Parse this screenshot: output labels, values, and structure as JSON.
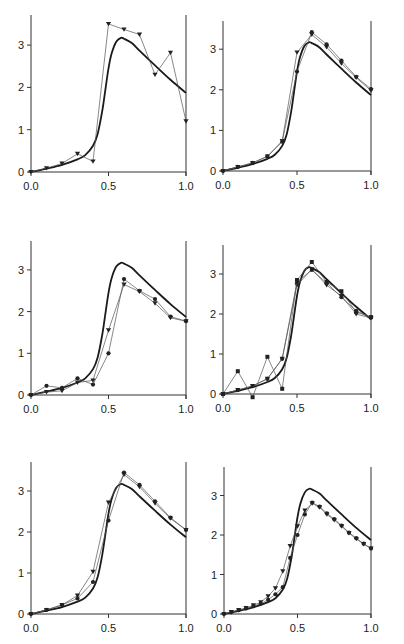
{
  "figure": {
    "width": 404,
    "height": 644,
    "colors": {
      "axis": "#333333",
      "reference": "#1a1a1a",
      "data": "#555555",
      "marker": "#222222"
    }
  },
  "reference_curve": {
    "name": "reference",
    "x": [
      0.0,
      0.1,
      0.2,
      0.3,
      0.35,
      0.4,
      0.43,
      0.46,
      0.48,
      0.5,
      0.52,
      0.55,
      0.58,
      0.6,
      0.65,
      0.7,
      0.8,
      0.9,
      1.0
    ],
    "y": [
      0.0,
      0.08,
      0.17,
      0.3,
      0.4,
      0.62,
      0.9,
      1.45,
      1.95,
      2.45,
      2.8,
      3.08,
      3.17,
      3.15,
      3.05,
      2.87,
      2.52,
      2.18,
      1.87
    ]
  },
  "chart_data": [
    {
      "type": "line",
      "panel": "top-left",
      "xlabel": "",
      "ylabel": "",
      "xlim": [
        0,
        1
      ],
      "ylim": [
        0,
        3.7
      ],
      "xticks": [
        "0.0",
        "0.5",
        "1.0"
      ],
      "yticks": [
        "0",
        "1",
        "2",
        "3"
      ],
      "grid": false,
      "series": [
        {
          "name": "reference",
          "style": "thick",
          "ref": true
        },
        {
          "name": "triangles",
          "marker": "triangle-down",
          "x": [
            0.0,
            0.1,
            0.2,
            0.3,
            0.4,
            0.5,
            0.6,
            0.7,
            0.8,
            0.9,
            1.0
          ],
          "y": [
            0.0,
            0.09,
            0.2,
            0.43,
            0.25,
            3.5,
            3.37,
            3.25,
            2.3,
            2.82,
            1.2
          ]
        }
      ]
    },
    {
      "type": "line",
      "panel": "top-right",
      "xlim": [
        0,
        1
      ],
      "ylim": [
        0,
        3.7
      ],
      "xticks": [
        "0.0",
        "0.5",
        "1.0"
      ],
      "yticks": [
        "0",
        "1",
        "2",
        "3"
      ],
      "grid": false,
      "series": [
        {
          "name": "reference",
          "style": "thick",
          "ref": true
        },
        {
          "name": "triangles",
          "marker": "triangle-down",
          "x": [
            0.0,
            0.1,
            0.2,
            0.3,
            0.4,
            0.5,
            0.6,
            0.7,
            0.8,
            0.9,
            1.0
          ],
          "y": [
            0.0,
            0.1,
            0.2,
            0.36,
            0.74,
            2.92,
            3.36,
            3.05,
            2.65,
            2.3,
            1.98
          ]
        },
        {
          "name": "circles",
          "marker": "circle",
          "x": [
            0.0,
            0.1,
            0.2,
            0.3,
            0.4,
            0.5,
            0.6,
            0.7,
            0.8,
            0.9,
            1.0
          ],
          "y": [
            0.0,
            0.1,
            0.2,
            0.36,
            0.72,
            2.45,
            3.42,
            3.12,
            2.72,
            2.32,
            2.02
          ]
        }
      ]
    },
    {
      "type": "line",
      "panel": "middle-left",
      "xlim": [
        0,
        1
      ],
      "ylim": [
        0,
        3.7
      ],
      "xticks": [
        "0.0",
        "0.5",
        "1.0"
      ],
      "yticks": [
        "0",
        "1",
        "2",
        "3"
      ],
      "grid": false,
      "series": [
        {
          "name": "reference",
          "style": "thick",
          "ref": true
        },
        {
          "name": "triangles",
          "marker": "triangle-down",
          "x": [
            0.0,
            0.1,
            0.2,
            0.3,
            0.4,
            0.5,
            0.6,
            0.7,
            0.8,
            0.9,
            1.0
          ],
          "y": [
            0.0,
            0.07,
            0.1,
            0.3,
            0.35,
            1.55,
            2.65,
            2.48,
            2.2,
            1.85,
            1.77
          ]
        },
        {
          "name": "circles",
          "marker": "circle",
          "x": [
            0.0,
            0.1,
            0.2,
            0.3,
            0.4,
            0.5,
            0.6,
            0.7,
            0.8,
            0.9,
            1.0
          ],
          "y": [
            0.0,
            0.22,
            0.17,
            0.4,
            0.25,
            1.0,
            2.78,
            2.5,
            2.3,
            1.88,
            1.77
          ]
        }
      ]
    },
    {
      "type": "line",
      "panel": "middle-right",
      "xlim": [
        0,
        1
      ],
      "ylim": [
        0,
        3.7
      ],
      "xticks": [
        "0.0",
        "0.5",
        "1.0"
      ],
      "yticks": [
        "0",
        "1",
        "2",
        "3"
      ],
      "grid": false,
      "series": [
        {
          "name": "reference",
          "style": "thick",
          "ref": true
        },
        {
          "name": "squares",
          "marker": "square",
          "x": [
            0.0,
            0.1,
            0.2,
            0.3,
            0.4,
            0.5,
            0.6,
            0.7,
            0.8,
            0.9,
            1.0
          ],
          "y": [
            0.0,
            0.57,
            -0.08,
            0.93,
            0.13,
            2.85,
            3.3,
            2.8,
            2.57,
            2.05,
            1.92
          ]
        },
        {
          "name": "triangles",
          "marker": "triangle-down",
          "x": [
            0.0,
            0.1,
            0.2,
            0.3,
            0.4,
            0.5,
            0.6,
            0.7,
            0.8,
            0.9,
            1.0
          ],
          "y": [
            0.0,
            0.1,
            0.2,
            0.38,
            0.88,
            2.72,
            3.12,
            2.72,
            2.45,
            2.0,
            1.9
          ]
        },
        {
          "name": "circles",
          "marker": "circle",
          "x": [
            0.0,
            0.1,
            0.2,
            0.3,
            0.4,
            0.5,
            0.6,
            0.7,
            0.8,
            0.9,
            1.0
          ],
          "y": [
            0.0,
            0.1,
            0.2,
            0.38,
            0.88,
            2.8,
            3.1,
            2.78,
            2.42,
            2.08,
            1.92
          ]
        }
      ]
    },
    {
      "type": "line",
      "panel": "bottom-left",
      "xlim": [
        0,
        1
      ],
      "ylim": [
        0,
        3.7
      ],
      "xticks": [
        "0.0",
        "0.5",
        "1.0"
      ],
      "yticks": [
        "0",
        "1",
        "2",
        "3"
      ],
      "grid": false,
      "series": [
        {
          "name": "reference",
          "style": "thick",
          "ref": true
        },
        {
          "name": "triangles",
          "marker": "triangle-down",
          "x": [
            0.0,
            0.1,
            0.2,
            0.3,
            0.4,
            0.5,
            0.6,
            0.7,
            0.8,
            0.9,
            1.0
          ],
          "y": [
            0.0,
            0.1,
            0.22,
            0.45,
            1.03,
            2.72,
            3.4,
            3.1,
            2.7,
            2.33,
            2.05
          ]
        },
        {
          "name": "circles",
          "marker": "circle",
          "x": [
            0.0,
            0.1,
            0.2,
            0.3,
            0.4,
            0.5,
            0.6,
            0.7,
            0.8,
            0.9,
            1.0
          ],
          "y": [
            0.0,
            0.1,
            0.22,
            0.38,
            0.78,
            2.28,
            3.45,
            3.15,
            2.75,
            2.35,
            2.05
          ]
        }
      ]
    },
    {
      "type": "line",
      "panel": "bottom-right",
      "xlim": [
        0,
        1
      ],
      "ylim": [
        0,
        3.7
      ],
      "xticks": [
        "0.0",
        "0.5",
        "1.0"
      ],
      "yticks": [
        "0",
        "1",
        "2",
        "3"
      ],
      "grid": false,
      "series": [
        {
          "name": "reference",
          "style": "thick",
          "ref": true
        },
        {
          "name": "triangles",
          "marker": "triangle-down",
          "x": [
            0.0,
            0.05,
            0.1,
            0.15,
            0.2,
            0.25,
            0.3,
            0.35,
            0.4,
            0.45,
            0.5,
            0.55,
            0.6,
            0.65,
            0.7,
            0.75,
            0.8,
            0.85,
            0.9,
            0.95,
            1.0
          ],
          "y": [
            0.0,
            0.05,
            0.1,
            0.15,
            0.22,
            0.3,
            0.45,
            0.65,
            1.08,
            1.72,
            2.22,
            2.62,
            2.8,
            2.7,
            2.52,
            2.38,
            2.22,
            2.05,
            1.9,
            1.77,
            1.66
          ]
        },
        {
          "name": "circles",
          "marker": "circle",
          "x": [
            0.0,
            0.05,
            0.1,
            0.15,
            0.2,
            0.25,
            0.3,
            0.35,
            0.4,
            0.45,
            0.5,
            0.55,
            0.6,
            0.65,
            0.7,
            0.75,
            0.8,
            0.85,
            0.9,
            0.95,
            1.0
          ],
          "y": [
            0.0,
            0.05,
            0.1,
            0.14,
            0.2,
            0.26,
            0.36,
            0.5,
            0.68,
            1.42,
            2.0,
            2.52,
            2.82,
            2.72,
            2.55,
            2.4,
            2.24,
            2.06,
            1.92,
            1.78,
            1.66
          ]
        }
      ]
    }
  ],
  "panels_layout": [
    {
      "x0": 31,
      "x1": 186,
      "y0": 172,
      "yTop": 15,
      "pxPerUnit": 42.3
    },
    {
      "x0": 223,
      "x1": 371,
      "y0": 171,
      "yTop": 21,
      "pxPerUnit": 40.6
    },
    {
      "x0": 31,
      "x1": 186,
      "y0": 395,
      "yTop": 241,
      "pxPerUnit": 41.7
    },
    {
      "x0": 223,
      "x1": 371,
      "y0": 394,
      "yTop": 245,
      "pxPerUnit": 40.0
    },
    {
      "x0": 31,
      "x1": 186,
      "y0": 614,
      "yTop": 462,
      "pxPerUnit": 41.0
    },
    {
      "x0": 224,
      "x1": 371,
      "y0": 614,
      "yTop": 467,
      "pxPerUnit": 39.5
    }
  ]
}
